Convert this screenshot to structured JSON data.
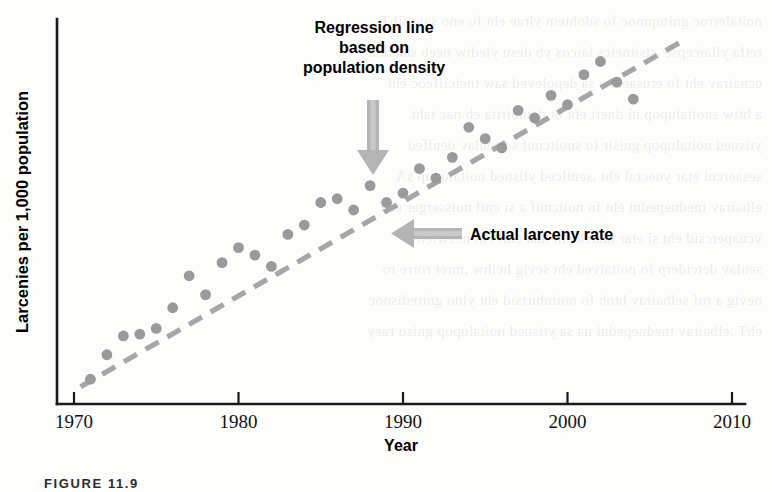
{
  "figure": {
    "caption_label": "FIGURE 11.9"
  },
  "annotations": {
    "regression_note": {
      "line1": "Regression line",
      "line2": "based on",
      "line3": "population density",
      "arrow": "down-arrow-icon"
    },
    "actual_note": {
      "text": "Actual larceny rate",
      "arrow": "left-arrow-icon"
    }
  },
  "chart_data": {
    "type": "scatter",
    "title": "",
    "xlabel": "Year",
    "ylabel": "Larcenies per 1,000 population",
    "xlim": [
      1970,
      2010
    ],
    "ylim": [
      0,
      100
    ],
    "xticks": [
      1970,
      1980,
      1990,
      2000,
      2010
    ],
    "xticklabels": [
      "1970",
      "1980",
      "1990",
      "2000",
      "2010"
    ],
    "yticks": [],
    "yticklabels": [],
    "grid": false,
    "legend": "none",
    "point_color": "#9a9a9a",
    "line_color": "#a6a6a6",
    "axis_color": "#1a1a1a",
    "series": [
      {
        "name": "Actual larceny rate",
        "marker": "circle",
        "x": [
          1971,
          1972,
          1973,
          1974,
          1975,
          1976,
          1977,
          1978,
          1979,
          1980,
          1981,
          1982,
          1983,
          1984,
          1985,
          1986,
          1987,
          1988,
          1989,
          1990,
          1991,
          1992,
          1993,
          1994,
          1995,
          1996,
          1997,
          1998,
          1999,
          2000,
          2001,
          2002,
          2003,
          2004
        ],
        "y": [
          5.0,
          11.5,
          16.5,
          17.0,
          18.5,
          24.0,
          32.5,
          27.5,
          36.0,
          40.0,
          38.0,
          35.0,
          43.5,
          46.0,
          52.0,
          53.0,
          50.0,
          56.5,
          52.0,
          54.5,
          61.0,
          58.5,
          64.0,
          72.0,
          69.0,
          66.5,
          76.5,
          74.5,
          80.5,
          78.0,
          86.0,
          89.5,
          84.0,
          79.5
        ]
      }
    ],
    "trendline": {
      "name": "Regression line based on population density",
      "style": "dashed",
      "x": [
        1970.4,
        2007.2
      ],
      "y": [
        3.0,
        95.5
      ]
    }
  },
  "ghost_text": {
    "lines": [
      "noitalerroc gnitupmoc fo sdohtem ylrae eht fo eno saw sihT",
      "retfa yllaicepse ,stsitneics laicos yb desu ylediw neeb sah dna",
      "ecnairav eht fo erusaem a sa depoleved saw tneiciffeoc eht",
      "a htiw snoitalupop ni dnert eht ot detubirtta eb nac taht",
      "ytisned noitalupop gnisir fo snoitcnuf sa seulav denifed",
      "sesaercni etar ynecral eht ,senilced ytisned noitalupop sA",
      "elbairav tnednepedni eht fo noitcnuf a si enil noisserger ehT",
      "ycnapercsid eht si etar lautca eht dna enil eht neewteb",
      "seulav detciderp fo noitaived eht sevig hcihw ,mret rorre ro",
      "nevig a rof selbairav htob fo noitubirtsid eht ylno gniredisnoc",
      "ehT .elbairav tnednepedni na sa ytisned noitalupop gnisu raey"
    ]
  }
}
